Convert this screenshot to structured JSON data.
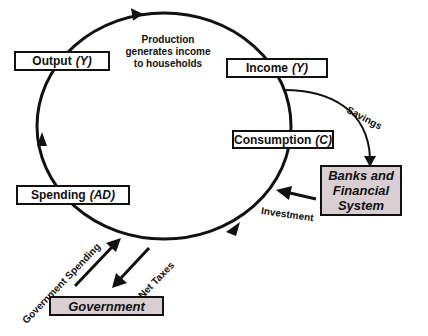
{
  "diagram": {
    "boxes": {
      "output": {
        "label": "Output",
        "symbol": "(Y)"
      },
      "income": {
        "label": "Income",
        "symbol": "(Y)"
      },
      "consumption": {
        "label": "Consumption",
        "symbol": "(C)"
      },
      "spending": {
        "label": "Spending",
        "symbol": "(AD)"
      },
      "banks": {
        "line1": "Banks and",
        "line2": "Financial",
        "line3": "System"
      },
      "government": {
        "label": "Government"
      }
    },
    "captions": {
      "production_line1": "Production",
      "production_line2": "generates income",
      "production_line3": "to households"
    },
    "flows": {
      "savings": "Savings",
      "investment": "Investment",
      "government_spending": "Government Spending",
      "net_taxes": "Net Taxes"
    },
    "colors": {
      "line": "#111111",
      "shaded_box": "#d9cfd3",
      "background": "#ffffff"
    }
  }
}
